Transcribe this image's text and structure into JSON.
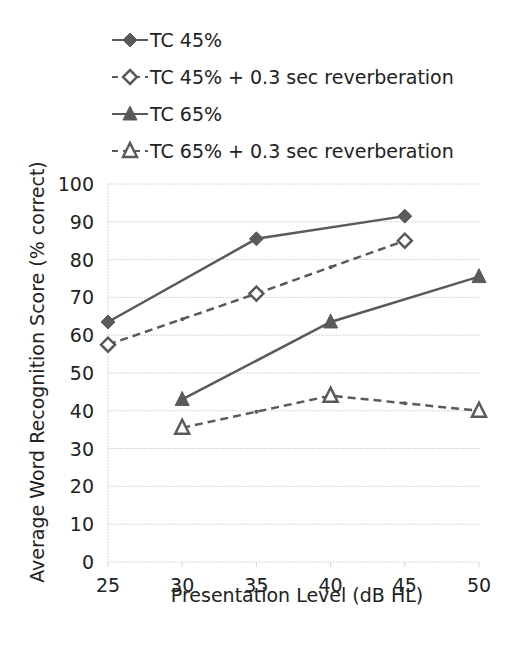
{
  "chart_data": {
    "type": "line",
    "title": "",
    "xlabel": "Presentation Level (dB HL)",
    "ylabel": "Average Word Recognition Score (% correct)",
    "x": [
      25,
      30,
      35,
      40,
      45,
      50
    ],
    "xlim": [
      25,
      50
    ],
    "ylim": [
      0,
      100
    ],
    "xticks": [
      "25",
      "30",
      "35",
      "40",
      "45",
      "50"
    ],
    "yticks": [
      "0",
      "10",
      "20",
      "30",
      "40",
      "50",
      "60",
      "70",
      "80",
      "90",
      "100"
    ],
    "grid": true,
    "legend_position": "top",
    "series": [
      {
        "name": "TC 45%",
        "style": "solid",
        "marker": "filled-diamond",
        "points": [
          [
            25,
            63.5
          ],
          [
            35,
            85.5
          ],
          [
            45,
            91.5
          ]
        ]
      },
      {
        "name": "TC 45% + 0.3 sec reverberation",
        "style": "dashed",
        "marker": "open-diamond",
        "points": [
          [
            25,
            57.5
          ],
          [
            35,
            71
          ],
          [
            45,
            85
          ]
        ]
      },
      {
        "name": "TC 65%",
        "style": "solid",
        "marker": "filled-triangle",
        "points": [
          [
            30,
            43
          ],
          [
            40,
            63.5
          ],
          [
            50,
            75.5
          ]
        ]
      },
      {
        "name": "TC 65% + 0.3 sec reverberation",
        "style": "dashed",
        "marker": "open-triangle",
        "points": [
          [
            30,
            35.5
          ],
          [
            40,
            44
          ],
          [
            50,
            40
          ]
        ]
      }
    ]
  },
  "colors": {
    "line": "#5a5a5a",
    "grid": "#d6d6d6",
    "text": "#222222"
  }
}
